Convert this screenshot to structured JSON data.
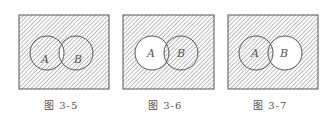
{
  "figures": [
    {
      "id": "3-5",
      "caption": "图  3-5",
      "label_a": "A",
      "label_b": "B",
      "shaded": "complement of A∩B",
      "x": 19,
      "w": 90
    },
    {
      "id": "3-6",
      "caption": "图  3-6",
      "label_a": "A",
      "label_b": "B",
      "shaded": "complement of A",
      "x": 123,
      "w": 91
    },
    {
      "id": "3-7",
      "caption": "图  3-7",
      "label_a": "A",
      "label_b": "B",
      "shaded": "complement of B",
      "x": 228,
      "w": 90
    }
  ],
  "colors": {
    "line": "#555555",
    "hatch": "#777777",
    "background": "#ffffff"
  }
}
